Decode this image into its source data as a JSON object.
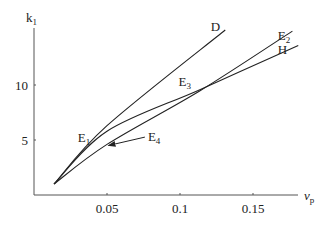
{
  "chart_data": {
    "type": "line",
    "title": "",
    "xlabel": "v",
    "xlabel_sub": "p",
    "ylabel": "k",
    "ylabel_sub": "1",
    "xlim": [
      0,
      0.182
    ],
    "ylim": [
      0,
      15.2
    ],
    "xticks": [
      0.05,
      0.1,
      0.15
    ],
    "xtick_labels": [
      "0.05",
      "0.1",
      "0.15"
    ],
    "yticks": [
      5,
      10
    ],
    "ytick_labels": [
      "5",
      "10"
    ],
    "grid": false,
    "series": [
      {
        "name": "D",
        "points": [
          [
            0.0137,
            1.0
          ],
          [
            0.05,
            6.3
          ],
          [
            0.131,
            15.0
          ]
        ]
      },
      {
        "name": "E2",
        "points": [
          [
            0.0137,
            1.0
          ],
          [
            0.05,
            4.6
          ],
          [
            0.114,
            9.5
          ],
          [
            0.177,
            14.9
          ]
        ]
      },
      {
        "name": "H",
        "points": [
          [
            0.0137,
            1.0
          ],
          [
            0.05,
            5.8
          ],
          [
            0.114,
            9.6
          ],
          [
            0.181,
            13.6
          ]
        ]
      }
    ],
    "annotations": [
      {
        "text": "D",
        "x": 0.121,
        "y": 14.9
      },
      {
        "text": "E",
        "sub": "2",
        "x": 0.167,
        "y": 14.1
      },
      {
        "text": "H",
        "x": 0.167,
        "y": 12.8
      },
      {
        "text": "E",
        "sub": "3",
        "x": 0.099,
        "y": 9.9
      },
      {
        "text": "E",
        "sub": "1",
        "x": 0.03,
        "y": 4.8
      },
      {
        "text": "E",
        "sub": "4",
        "x": 0.078,
        "y": 4.9,
        "arrow_to": [
          0.051,
          4.5
        ]
      }
    ]
  }
}
